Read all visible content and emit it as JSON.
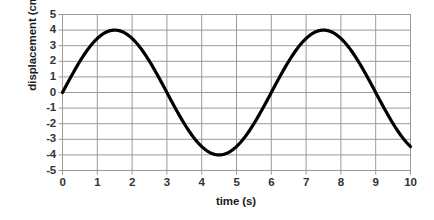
{
  "chart_data": {
    "type": "line",
    "title": "",
    "xlabel": "time (s)",
    "ylabel": "displacement (cm)",
    "xlim": [
      0,
      10
    ],
    "ylim": [
      -5,
      5
    ],
    "xticks": [
      "0",
      "1",
      "2",
      "3",
      "4",
      "5",
      "6",
      "7",
      "8",
      "9",
      "10"
    ],
    "yticks": [
      "5",
      "4",
      "3",
      "2",
      "1",
      "0",
      "-1",
      "-2",
      "-3",
      "-4",
      "-5"
    ],
    "grid": "both",
    "legend": "none",
    "series": [
      {
        "name": "displacement",
        "equation": "y = 4 sin(2 pi t / 6)",
        "amplitude_cm": 4,
        "period_s": 6,
        "color": "#000000",
        "line_width_px": 3.2,
        "x": [
          0,
          0.25,
          0.5,
          0.75,
          1,
          1.25,
          1.5,
          1.75,
          2,
          2.25,
          2.5,
          2.75,
          3,
          3.25,
          3.5,
          3.75,
          4,
          4.25,
          4.5,
          4.75,
          5,
          5.25,
          5.5,
          5.75,
          6,
          6.25,
          6.5,
          6.75,
          7,
          7.25,
          7.5,
          7.75,
          8,
          8.25,
          8.5,
          8.75,
          9,
          9.25,
          9.5,
          9.75,
          10
        ],
        "values": [
          0,
          1.02,
          2,
          2.83,
          3.46,
          3.86,
          4,
          3.86,
          3.46,
          2.83,
          2,
          1.02,
          0,
          -1.02,
          -2,
          -2.83,
          -3.46,
          -3.86,
          -4,
          -3.86,
          -3.46,
          -2.83,
          -2,
          -1.02,
          0,
          1.02,
          2,
          2.83,
          3.46,
          3.86,
          4,
          3.86,
          3.46,
          2.83,
          2,
          1.02,
          0,
          -1.02,
          -2,
          -2.83,
          -3.46
        ]
      }
    ],
    "key_points": {
      "start": [
        0,
        0
      ],
      "first_peak": [
        1.5,
        4
      ],
      "first_zero_descending": [
        3,
        0
      ],
      "trough": [
        4.5,
        -4
      ],
      "second_zero_ascending": [
        6,
        0
      ],
      "second_peak": [
        7.5,
        4
      ],
      "end": [
        10,
        -3.46
      ]
    },
    "colors": {
      "curve": "#000000",
      "gridline": "#9a9a9a",
      "plot_border": "#9a9a9a",
      "tick_text": "#333333",
      "axis_title": "#1a1a1a",
      "background": "#ffffff"
    }
  }
}
